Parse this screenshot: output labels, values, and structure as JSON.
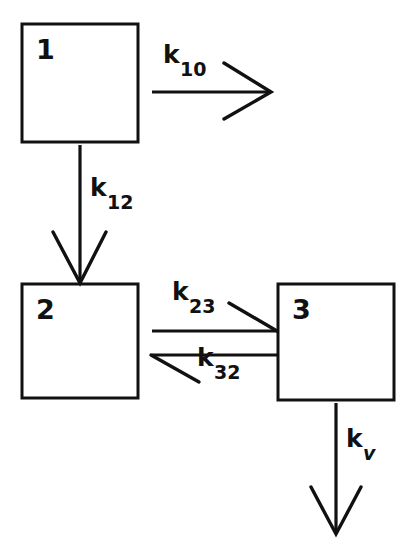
{
  "diagram": {
    "background_color": "#ffffff",
    "stroke_color": "#111111",
    "boxes": [
      {
        "id": "box-1",
        "label": "1",
        "x": 22,
        "y": 24,
        "width": 116,
        "height": 118
      },
      {
        "id": "box-2",
        "label": "2",
        "x": 22,
        "y": 284,
        "width": 116,
        "height": 114
      },
      {
        "id": "box-3",
        "label": "3",
        "x": 278,
        "y": 284,
        "width": 116,
        "height": 116
      }
    ],
    "rate_labels": [
      {
        "id": "k10",
        "base": "k",
        "subscript": "10",
        "subscript_style": "upright"
      },
      {
        "id": "k12",
        "base": "k",
        "subscript": "12",
        "subscript_style": "upright"
      },
      {
        "id": "k23",
        "base": "k",
        "subscript": "23",
        "subscript_style": "upright"
      },
      {
        "id": "k32",
        "base": "k",
        "subscript": "32",
        "subscript_style": "upright"
      },
      {
        "id": "kv",
        "base": "k",
        "subscript": "v",
        "subscript_style": "italic"
      }
    ],
    "arrows": [
      {
        "id": "arrow-k10",
        "from": "box-1",
        "to": "elimination",
        "direction": "right",
        "head": "open-chevron"
      },
      {
        "id": "arrow-k12",
        "from": "box-1",
        "to": "box-2",
        "direction": "down",
        "head": "open-chevron"
      },
      {
        "id": "arrow-k23",
        "from": "box-2",
        "to": "box-3",
        "direction": "right",
        "head": "half-barb-upper"
      },
      {
        "id": "arrow-k32",
        "from": "box-3",
        "to": "box-2",
        "direction": "left",
        "head": "half-barb-lower"
      },
      {
        "id": "arrow-kv",
        "from": "box-3",
        "to": "elimination",
        "direction": "down",
        "head": "open-chevron"
      }
    ]
  }
}
